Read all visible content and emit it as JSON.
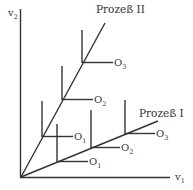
{
  "diagram": {
    "colors": {
      "line": "#333333",
      "text": "#333333",
      "background": "#ffffff"
    },
    "axes": {
      "y_label": "v",
      "y_label_sub": "2",
      "x_label": "v",
      "x_label_sub": "1"
    },
    "processes": [
      {
        "name": "Prozeß II",
        "outputs": [
          {
            "label": "O",
            "sub": "1"
          },
          {
            "label": "O",
            "sub": "2"
          },
          {
            "label": "O",
            "sub": "3"
          }
        ]
      },
      {
        "name": "Prozeß I",
        "outputs": [
          {
            "label": "O",
            "sub": "1"
          },
          {
            "label": "O",
            "sub": "2"
          },
          {
            "label": "O",
            "sub": "3"
          }
        ]
      }
    ]
  }
}
